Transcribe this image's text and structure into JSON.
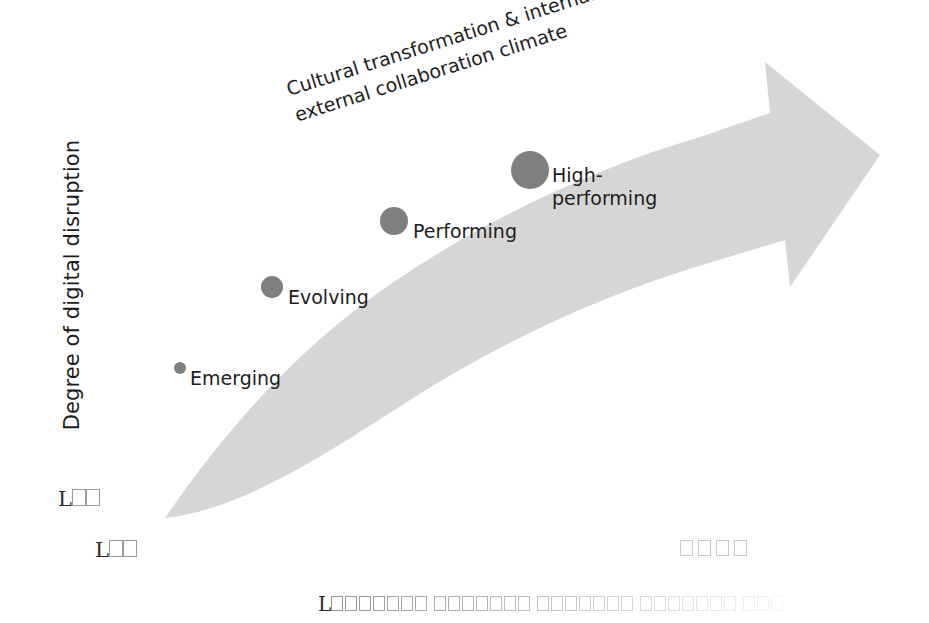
{
  "canvas": {
    "width": 929,
    "height": 623,
    "background": "#ffffff"
  },
  "axes": {
    "y_label": "Degree of digital disruption"
  },
  "caption": {
    "line1": "Cultural transformation & internal and",
    "line2": "external collaboration climate",
    "rotation_deg": -17.5
  },
  "colors": {
    "bubble": "#7f7f7f",
    "arrow": "#d6d6d6",
    "text": "#1d1d1d",
    "tofu_border": "#9a9a9a",
    "tofu_border_light": "#c8c8c8"
  },
  "stages": [
    {
      "name": "Emerging",
      "label": "Emerging",
      "radius": 6,
      "cx": 180,
      "cy": 368,
      "label_x": 190,
      "label_y": 367
    },
    {
      "name": "Evolving",
      "label": "Evolving",
      "radius": 11,
      "cx": 272,
      "cy": 287,
      "label_x": 288,
      "label_y": 286
    },
    {
      "name": "Performing",
      "label": "Performing",
      "radius": 14,
      "cx": 394,
      "cy": 221,
      "label_x": 413,
      "label_y": 220
    },
    {
      "name": "High-performing",
      "label": "High-\nperforming",
      "radius": 19,
      "cx": 530,
      "cy": 170,
      "label_x": 552,
      "label_y": 164
    }
  ],
  "unrendered_labels": {
    "left_upper": {
      "lead": "L",
      "boxes": 2
    },
    "left_lower": {
      "lead": "L",
      "boxes": 2
    },
    "right_group": {
      "lead": "",
      "boxes": 4
    },
    "bottom": {
      "lead": "L",
      "boxes": 31
    }
  },
  "chart_data": {
    "type": "scatter",
    "title": "",
    "xlabel": "",
    "ylabel": "Degree of digital disruption",
    "annotations": [
      "Cultural transformation & internal and external collaboration climate"
    ],
    "legend": "none",
    "grid": false,
    "series": [
      {
        "name": "Digital maturity stages",
        "points": [
          {
            "label": "Emerging",
            "x": 1,
            "y": 1,
            "size": 6
          },
          {
            "label": "Evolving",
            "x": 2,
            "y": 2,
            "size": 11
          },
          {
            "label": "Performing",
            "x": 3,
            "y": 3,
            "size": 14
          },
          {
            "label": "High-performing",
            "x": 4,
            "y": 4,
            "size": 19
          }
        ]
      }
    ],
    "xlim": [
      0,
      5
    ],
    "ylim": [
      0,
      5
    ]
  }
}
